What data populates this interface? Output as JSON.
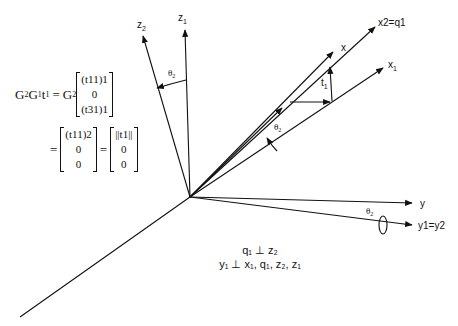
{
  "equation": {
    "lhs": "G",
    "lhs_sub1": "2",
    "lhs_mid": "G",
    "lhs_sub2": "1",
    "lhs_t": "t",
    "lhs_t_sub": "1",
    "eq": "=",
    "g2": "G",
    "g2_sub": "2",
    "m1": [
      "(t11)1",
      "0",
      "(t31)1"
    ],
    "m2": [
      "(t11)2",
      "0",
      "0"
    ],
    "m3": [
      "||t1||",
      "0",
      "0"
    ]
  },
  "axes": {
    "z2": "z",
    "z2_sub": "2",
    "z1": "z",
    "z1_sub": "1",
    "x2q1": "x2=q1",
    "x": "x",
    "x1": "x",
    "x1_sub": "1",
    "t1": "t",
    "t1_sub": "1",
    "y": "y",
    "y1y2": "y1=y2",
    "theta": "θ",
    "theta_sub": "2"
  },
  "caption": {
    "line1": "q₁ ⊥ z₂",
    "line2": "y₁ ⊥ x₁, q₁, z₂, z₁"
  }
}
